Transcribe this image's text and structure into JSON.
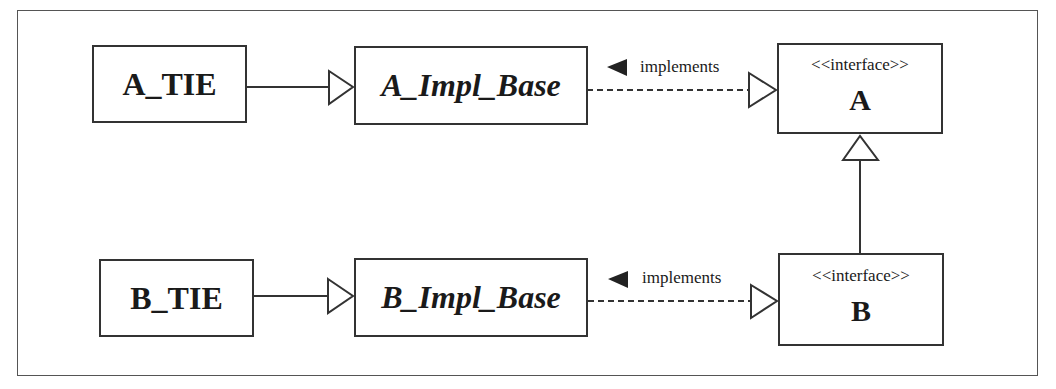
{
  "diagram": {
    "type": "UML class diagram",
    "nodes": {
      "a_tie": {
        "label": "A_TIE"
      },
      "a_impl_base": {
        "label": "A_Impl_Base"
      },
      "interface_a": {
        "stereotype": "<<interface>>",
        "label": "A"
      },
      "b_tie": {
        "label": "B_TIE"
      },
      "b_impl_base": {
        "label": "B_Impl_Base"
      },
      "interface_b": {
        "stereotype": "<<interface>>",
        "label": "B"
      }
    },
    "edges": [
      {
        "from": "A_TIE",
        "to": "A_Impl_Base",
        "kind": "generalization"
      },
      {
        "from": "A_Impl_Base",
        "to": "A",
        "kind": "realization",
        "label": "implements"
      },
      {
        "from": "B_TIE",
        "to": "B_Impl_Base",
        "kind": "generalization"
      },
      {
        "from": "B_Impl_Base",
        "to": "B",
        "kind": "realization",
        "label": "implements"
      },
      {
        "from": "B",
        "to": "A",
        "kind": "generalization"
      }
    ],
    "edge_labels": {
      "implements_a": "implements",
      "implements_b": "implements"
    },
    "colors": {
      "line": "#333333",
      "background": "#ffffff"
    }
  }
}
